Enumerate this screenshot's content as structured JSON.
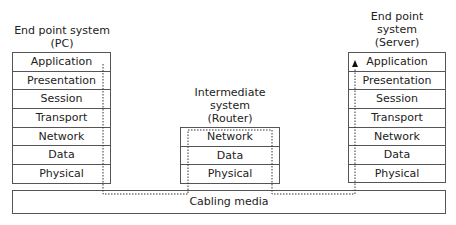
{
  "diagram": {
    "left": {
      "title_line1": "End point system",
      "title_line2": "(PC)",
      "layers": [
        "Application",
        "Presentation",
        "Session",
        "Transport",
        "Network",
        "Data",
        "Physical"
      ]
    },
    "router": {
      "title_line1": "Intermediate",
      "title_line2": "system",
      "title_line3": "(Router)",
      "layers": [
        "Network",
        "Data",
        "Physical"
      ]
    },
    "right": {
      "title_line1": "End point",
      "title_line2": "system",
      "title_line3": "(Server)",
      "layers": [
        "Application",
        "Presentation",
        "Session",
        "Transport",
        "Network",
        "Data",
        "Physical"
      ]
    },
    "cabling": "Cabling media"
  }
}
